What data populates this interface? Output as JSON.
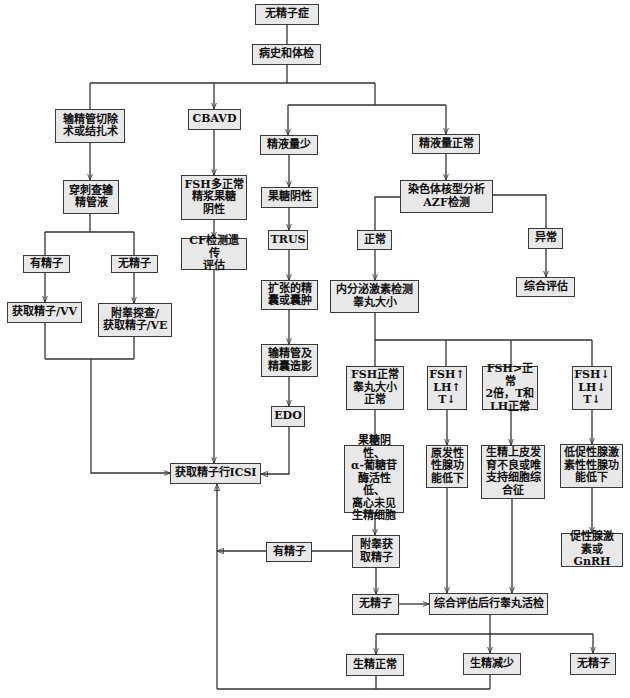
{
  "colors": {
    "background": "#ffffff",
    "box_fill": "#e8e8e8",
    "box_border": "#3a3a3a",
    "line": "#333333",
    "text": "#111111"
  },
  "nodes": {
    "azoospermia": {
      "label": "无精子症"
    },
    "history": {
      "label": "病史和体检"
    },
    "vasectomy": {
      "label": "输精管切除\n术或结扎术"
    },
    "cbavd": {
      "label": "CBAVD"
    },
    "low_volume": {
      "label": "精液量少"
    },
    "normal_volume": {
      "label": "精液量正常"
    },
    "puncture": {
      "label": "穿刺查输\n精管液"
    },
    "fsh_normal_fructose": {
      "label": "FSH多正常\n精浆果糖\n阴性"
    },
    "fructose_neg": {
      "label": "果糖阴性"
    },
    "karyotype": {
      "label": "染色体核型分析\nAZF检测"
    },
    "cf": {
      "label": "CF检测遗传\n评估"
    },
    "trus": {
      "label": "TRUS"
    },
    "normal": {
      "label": "正常"
    },
    "abnormal": {
      "label": "异常"
    },
    "sperm_yes_1": {
      "label": "有精子"
    },
    "sperm_no_1": {
      "label": "无精子"
    },
    "dilated": {
      "label": "扩张的精\n囊或囊肿"
    },
    "endocrine": {
      "label": "内分泌激素检测\n睾丸大小"
    },
    "comprehensive": {
      "label": "综合评估"
    },
    "vv": {
      "label": "获取精子/VV"
    },
    "ve": {
      "label": "附睾探查/\n获取精子/VE"
    },
    "vesiculography": {
      "label": "输精管及\n精囊造影"
    },
    "edo": {
      "label": "EDO"
    },
    "fsh_normal_testis": {
      "label": "FSH正常\n睾丸大小\n正常"
    },
    "fsh_up": {
      "label": "FSH↑\nLH↑\nT↓"
    },
    "fsh_2x": {
      "label": "FSH>正常\n2倍，T和\nLH正常"
    },
    "fsh_down": {
      "label": "FSH↓\nLH↓\nT↓"
    },
    "fructose_alpha": {
      "label": "果糖阴性、\nα-葡糖苷\n酶活性低、\n离心未见\n生精细胞"
    },
    "primary": {
      "label": "原发性\n性腺功\n能低下"
    },
    "seminiferous": {
      "label": "生精上皮发\n育不良或唯\n支持细胞综\n合征"
    },
    "hypogonadotropic": {
      "label": "低促性腺激\n素性性腺功\n能低下"
    },
    "icsi": {
      "label": "获取精子行ICSI"
    },
    "epididymal": {
      "label": "附睾获\n取精子"
    },
    "gnrh": {
      "label": "促性腺激\n素或GnRH"
    },
    "sperm_yes_2": {
      "label": "有精子"
    },
    "sperm_no_2": {
      "label": "无精子"
    },
    "biopsy": {
      "label": "综合评估后行睾丸活检"
    },
    "spermatogenesis_normal": {
      "label": "生精正常"
    },
    "spermatogenesis_reduced": {
      "label": "生精减少"
    },
    "sperm_no_3": {
      "label": "无精子"
    }
  },
  "edges": [
    {
      "from": "azoospermia",
      "to": "history"
    },
    {
      "from": "history",
      "to": "vasectomy"
    },
    {
      "from": "history",
      "to": "cbavd"
    },
    {
      "from": "history",
      "to": "low_volume"
    },
    {
      "from": "history",
      "to": "normal_volume"
    },
    {
      "from": "vasectomy",
      "to": "puncture"
    },
    {
      "from": "puncture",
      "to": "sperm_yes_1"
    },
    {
      "from": "puncture",
      "to": "sperm_no_1"
    },
    {
      "from": "sperm_yes_1",
      "to": "vv"
    },
    {
      "from": "sperm_no_1",
      "to": "ve"
    },
    {
      "from": "vv",
      "to": "icsi"
    },
    {
      "from": "ve",
      "to": "icsi"
    },
    {
      "from": "cbavd",
      "to": "fsh_normal_fructose"
    },
    {
      "from": "fsh_normal_fructose",
      "to": "cf"
    },
    {
      "from": "cf",
      "to": "icsi"
    },
    {
      "from": "low_volume",
      "to": "fructose_neg"
    },
    {
      "from": "fructose_neg",
      "to": "trus"
    },
    {
      "from": "trus",
      "to": "dilated"
    },
    {
      "from": "dilated",
      "to": "vesiculography"
    },
    {
      "from": "vesiculography",
      "to": "edo"
    },
    {
      "from": "edo",
      "to": "icsi"
    },
    {
      "from": "normal_volume",
      "to": "karyotype"
    },
    {
      "from": "karyotype",
      "to": "normal"
    },
    {
      "from": "karyotype",
      "to": "abnormal"
    },
    {
      "from": "abnormal",
      "to": "comprehensive"
    },
    {
      "from": "normal",
      "to": "endocrine"
    },
    {
      "from": "endocrine",
      "to": "fsh_normal_testis"
    },
    {
      "from": "endocrine",
      "to": "fsh_up"
    },
    {
      "from": "endocrine",
      "to": "fsh_2x"
    },
    {
      "from": "endocrine",
      "to": "fsh_down"
    },
    {
      "from": "fsh_normal_testis",
      "to": "fructose_alpha"
    },
    {
      "from": "fructose_alpha",
      "to": "epididymal"
    },
    {
      "from": "epididymal",
      "to": "sperm_yes_2"
    },
    {
      "from": "sperm_yes_2",
      "to": "icsi"
    },
    {
      "from": "epididymal",
      "to": "sperm_no_2"
    },
    {
      "from": "sperm_no_2",
      "to": "biopsy"
    },
    {
      "from": "fsh_up",
      "to": "primary"
    },
    {
      "from": "primary",
      "to": "biopsy"
    },
    {
      "from": "fsh_2x",
      "to": "seminiferous"
    },
    {
      "from": "seminiferous",
      "to": "biopsy"
    },
    {
      "from": "fsh_down",
      "to": "hypogonadotropic"
    },
    {
      "from": "hypogonadotropic",
      "to": "gnrh"
    },
    {
      "from": "biopsy",
      "to": "spermatogenesis_normal"
    },
    {
      "from": "biopsy",
      "to": "spermatogenesis_reduced"
    },
    {
      "from": "biopsy",
      "to": "sperm_no_3"
    },
    {
      "from": "spermatogenesis_normal",
      "to": "icsi"
    },
    {
      "from": "spermatogenesis_reduced",
      "to": "icsi"
    }
  ]
}
